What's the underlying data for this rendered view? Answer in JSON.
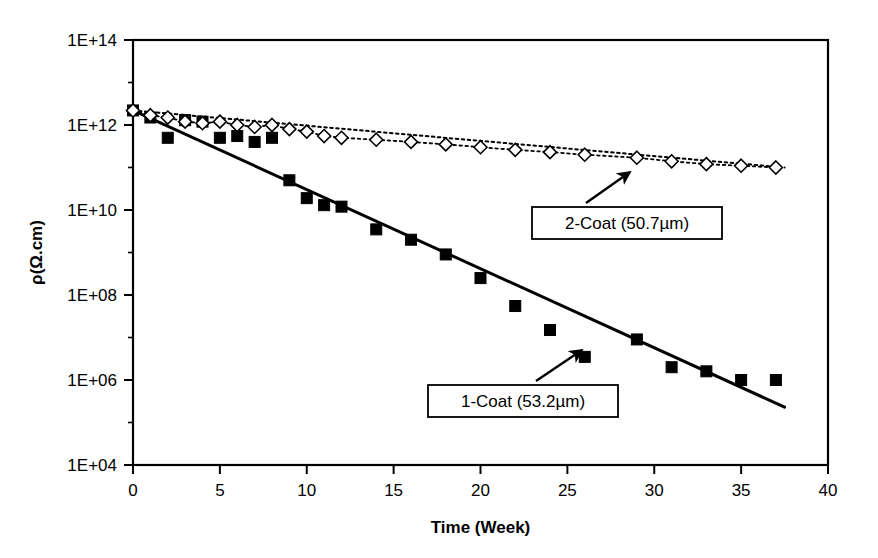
{
  "figure": {
    "background_color": "#ffffff",
    "plot_border_color": "#000000",
    "axis_color": "#000000"
  },
  "chart_data": {
    "type": "scatter",
    "title": "",
    "subtitle": "",
    "xlabel": "Time (Week)",
    "ylabel": "ρ(Ω.cm)",
    "xlim": [
      0,
      40
    ],
    "ylim": [
      10000.0,
      100000000000000.0
    ],
    "yscale": "log",
    "xscale": "linear",
    "grid": false,
    "legend_position": "none",
    "x_ticks": [
      0,
      5,
      10,
      15,
      20,
      25,
      30,
      35,
      40
    ],
    "x_tick_labels": [
      "0",
      "5",
      "10",
      "15",
      "20",
      "25",
      "30",
      "35",
      "40"
    ],
    "x_minor_ticks": [],
    "y_ticks": [
      10000.0,
      1000000.0,
      100000000.0,
      10000000000.0,
      1000000000000.0,
      100000000000000.0
    ],
    "y_tick_labels": [
      "1E+04",
      "1E+06",
      "1E+08",
      "1E+10",
      "1E+12",
      "1E+14"
    ],
    "y_minor_ticks": [
      100000.0,
      10000000.0,
      1000000000.0,
      100000000000.0,
      10000000000000.0
    ],
    "series": [
      {
        "name": "1-Coat (53.2µm)",
        "marker": "filled-square",
        "marker_color": "#000000",
        "line_style": "solid",
        "line_color": "#000000",
        "line_width": 3,
        "trendline": {
          "x0": 0,
          "y0": 2200000000000.0,
          "x1": 37.5,
          "y1": 230000.0
        },
        "x": [
          0,
          1,
          2,
          3,
          4,
          5,
          6,
          7,
          8,
          9,
          10,
          11,
          12,
          14,
          16,
          18,
          20,
          22,
          24,
          26,
          29,
          31,
          33,
          35,
          37
        ],
        "y": [
          2200000000000.0,
          1500000000000.0,
          500000000000.0,
          1300000000000.0,
          1200000000000.0,
          500000000000.0,
          550000000000.0,
          400000000000.0,
          500000000000.0,
          50000000000.0,
          19000000000.0,
          13000000000.0,
          12000000000.0,
          3500000000.0,
          2000000000.0,
          900000000.0,
          250000000.0,
          55000000.0,
          15000000.0,
          3500000.0,
          9000000.0,
          2000000.0,
          1600000.0,
          1000000.0,
          1000000.0
        ]
      },
      {
        "name": "2-Coat (50.7µm)",
        "marker": "open-diamond",
        "marker_color": "#000000",
        "marker_fill": "#ffffff",
        "line_style": "dotted",
        "line_color": "#000000",
        "line_width": 2,
        "trendline": {
          "x0": 0,
          "y0": 2200000000000.0,
          "x1": 37.5,
          "y1": 100000000000.0
        },
        "x": [
          0,
          1,
          2,
          3,
          4,
          5,
          6,
          7,
          8,
          9,
          10,
          11,
          12,
          14,
          16,
          18,
          20,
          22,
          24,
          26,
          29,
          31,
          33,
          35,
          37
        ],
        "y": [
          2200000000000.0,
          1700000000000.0,
          1500000000000.0,
          1200000000000.0,
          1100000000000.0,
          1200000000000.0,
          1000000000000.0,
          900000000000.0,
          1000000000000.0,
          800000000000.0,
          700000000000.0,
          550000000000.0,
          500000000000.0,
          450000000000.0,
          400000000000.0,
          350000000000.0,
          300000000000.0,
          260000000000.0,
          230000000000.0,
          200000000000.0,
          170000000000.0,
          140000000000.0,
          120000000000.0,
          110000000000.0,
          100000000000.0
        ]
      }
    ],
    "annotations": [
      {
        "label": "2-Coat (50.7µm)",
        "box_x": 532,
        "box_y": 207,
        "box_w": 190,
        "box_h": 32,
        "arrow_from_x": 586,
        "arrow_from_y": 203,
        "arrow_to_x": 630,
        "arrow_to_y": 172
      },
      {
        "label": "1-Coat (53.2µm)",
        "box_x": 428,
        "box_y": 385,
        "box_w": 190,
        "box_h": 32,
        "arrow_from_x": 536,
        "arrow_from_y": 381,
        "arrow_to_x": 582,
        "arrow_to_y": 350
      }
    ]
  }
}
